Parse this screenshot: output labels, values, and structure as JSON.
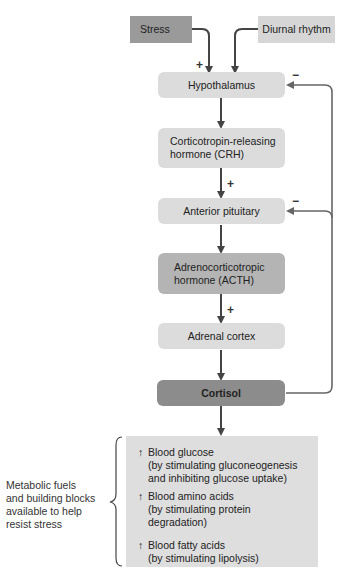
{
  "diagram": {
    "inputs": [
      {
        "label": "Stress",
        "sign": "+"
      },
      {
        "label": "Diurnal rhythm"
      }
    ],
    "chain": [
      {
        "label": "Hypothalamus",
        "shade": "light",
        "feedback_sign": "−"
      },
      {
        "label": "Corticotropin-releasing hormone (CRH)",
        "line1": "Corticotropin-releasing",
        "line2": "hormone (CRH)",
        "shade": "light"
      },
      {
        "label": "Anterior pituitary",
        "shade": "light",
        "incoming_sign": "+",
        "feedback_sign": "−"
      },
      {
        "label": "Adrenocorticotropic hormone (ACTH)",
        "line1": "Adrenocorticotropic",
        "line2": "hormone (ACTH)",
        "shade": "mid"
      },
      {
        "label": "Adrenal cortex",
        "shade": "light",
        "incoming_sign": "+"
      },
      {
        "label": "Cortisol",
        "shade": "dark"
      }
    ],
    "effects": [
      {
        "arrow": "↑",
        "title": "Blood glucose",
        "detail_line1": "(by stimulating gluconeogenesis",
        "detail_line2": "and inhibiting glucose uptake)"
      },
      {
        "arrow": "↑",
        "title": "Blood amino acids",
        "detail_line1": "(by stimulating protein degradation)"
      },
      {
        "arrow": "↑",
        "title": "Blood fatty acids",
        "detail_line1": "(by stimulating lipolysis)"
      }
    ],
    "side_label": {
      "line1": "Metabolic fuels",
      "line2": "and building blocks",
      "line3": "available to help",
      "line4": "resist stress"
    },
    "colors": {
      "light": "#dcdcdc",
      "mid": "#b4b4b4",
      "dark": "#8c8c8c",
      "arrow": "#444444",
      "feedback": "#666666"
    }
  }
}
